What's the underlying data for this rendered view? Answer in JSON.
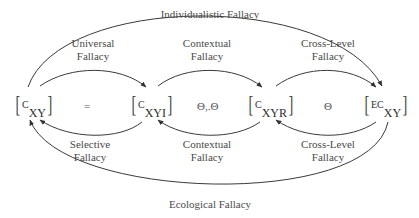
{
  "nodes": [
    {
      "id": "cxy",
      "prefix": "C",
      "sub": "XY"
    },
    {
      "id": "cxyi",
      "prefix": "C",
      "sub": "XYI"
    },
    {
      "id": "cxyr",
      "prefix": "C",
      "sub": "XYR"
    },
    {
      "id": "ecxy",
      "prefix": "EC",
      "sub": "XY"
    }
  ],
  "operators": {
    "op1": "=",
    "op2": "Θ,.Θ",
    "op3": "Θ"
  },
  "labels": {
    "individualistic": "Individualistic Fallacy",
    "universal_1": "Universal",
    "universal_2": "Fallacy",
    "contextual_top_1": "Contextual",
    "contextual_top_2": "Fallacy",
    "crosslevel_top_1": "Cross-Level",
    "crosslevel_top_2": "Fallacy",
    "selective_1": "Selective",
    "selective_2": "Fallacy",
    "contextual_bot_1": "Contextual",
    "contextual_bot_2": "Fallacy",
    "crosslevel_bot_1": "Cross-Level",
    "crosslevel_bot_2": "Fallacy",
    "ecological": "Ecological Fallacy"
  },
  "arrows": [
    {
      "from": "cxy",
      "to": "ecxy",
      "label": "Individualistic Fallacy",
      "side": "top-outer"
    },
    {
      "from": "cxy",
      "to": "cxyi",
      "label": "Universal Fallacy",
      "side": "top"
    },
    {
      "from": "cxyi",
      "to": "cxyr",
      "label": "Contextual Fallacy",
      "side": "top"
    },
    {
      "from": "cxyr",
      "to": "ecxy",
      "label": "Cross-Level Fallacy",
      "side": "top"
    },
    {
      "from": "cxyi",
      "to": "cxy",
      "label": "Selective Fallacy",
      "side": "bottom"
    },
    {
      "from": "cxyr",
      "to": "cxyi",
      "label": "Contextual Fallacy",
      "side": "bottom"
    },
    {
      "from": "ecxy",
      "to": "cxyr",
      "label": "Cross-Level Fallacy",
      "side": "bottom"
    },
    {
      "from": "ecxy",
      "to": "cxy",
      "label": "Ecological Fallacy",
      "side": "bottom-outer"
    }
  ],
  "colors": {
    "line": "#3a3a3a",
    "text": "#4a4a4a"
  }
}
